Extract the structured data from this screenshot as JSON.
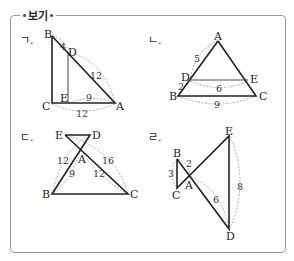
{
  "header": {
    "title": "보기"
  },
  "figures": {
    "g": {
      "label": "ㄱ.",
      "points": {
        "A": "A",
        "B": "B",
        "C": "C",
        "D": "D",
        "E": "E"
      },
      "measures": {
        "BD": "4",
        "DA": "12",
        "EA": "9",
        "CA": "12"
      }
    },
    "n": {
      "label": "ㄴ.",
      "points": {
        "A": "A",
        "B": "B",
        "C": "C",
        "D": "D",
        "E": "E"
      },
      "measures": {
        "AD": "5",
        "DB": "2",
        "DE": "6",
        "BC": "9"
      }
    },
    "d": {
      "label": "ㄷ.",
      "points": {
        "A": "A",
        "B": "B",
        "C": "C",
        "D": "D",
        "E": "E"
      },
      "measures": {
        "BD": "12",
        "AB": "9",
        "EC": "16",
        "AC": "12"
      }
    },
    "r": {
      "label": "ㄹ.",
      "points": {
        "A": "A",
        "B": "B",
        "C": "C",
        "D": "D",
        "E": "E"
      },
      "measures": {
        "BC": "3",
        "BA": "2",
        "AD": "6",
        "ED": "8"
      }
    }
  }
}
